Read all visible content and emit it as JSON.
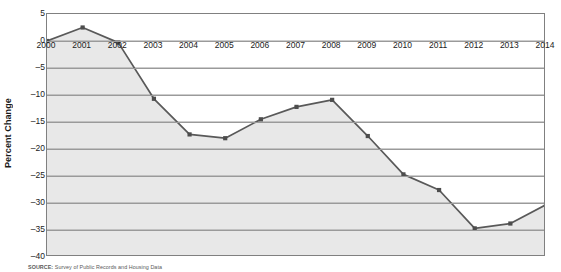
{
  "chart_data": {
    "type": "area",
    "title": "",
    "subtitle": "",
    "xlabel": "",
    "ylabel": "Percent Change",
    "categories": [
      "2000",
      "2001",
      "2002",
      "2003",
      "2004",
      "2005",
      "2006",
      "2007",
      "2008",
      "2009",
      "2010",
      "2011",
      "2012",
      "2013",
      "2014"
    ],
    "x": [
      2000,
      2001,
      2002,
      2003,
      2004,
      2005,
      2006,
      2007,
      2008,
      2009,
      2010,
      2011,
      2012,
      2013,
      2014
    ],
    "values": [
      0,
      2.5,
      -0.3,
      -10.7,
      -17.3,
      -18.0,
      -14.5,
      -12.2,
      -10.9,
      -17.6,
      -24.7,
      -27.6,
      -34.7,
      -33.8,
      -30.3
    ],
    "series": [
      {
        "name": "Percent Change",
        "values": [
          0,
          2.5,
          -0.3,
          -10.7,
          -17.3,
          -18.0,
          -14.5,
          -12.2,
          -10.9,
          -17.6,
          -24.7,
          -27.6,
          -34.7,
          -33.8,
          -30.3
        ]
      }
    ],
    "ylim": [
      -40,
      5
    ],
    "xlim": [
      2000,
      2014
    ],
    "yticks": [
      5,
      0,
      -5,
      -10,
      -15,
      -20,
      -25,
      -30,
      -35,
      -40
    ],
    "ytick_labels": [
      "5",
      "0",
      "–5",
      "–10",
      "–15",
      "–20",
      "–25",
      "–30",
      "–35",
      "–40"
    ],
    "grid": true,
    "grid_axis": "y",
    "legend": false,
    "legend_position": "none",
    "marker": "square",
    "line_color": "#595959",
    "marker_color": "#4d4d4d",
    "fill_color": "#e8e8e8",
    "grid_color": "#9a9a9a",
    "frame_color": "#808080",
    "annotations": []
  },
  "source": {
    "prefix": "SOURCE:",
    "text": "Survey of Public Records and Housing Data"
  }
}
